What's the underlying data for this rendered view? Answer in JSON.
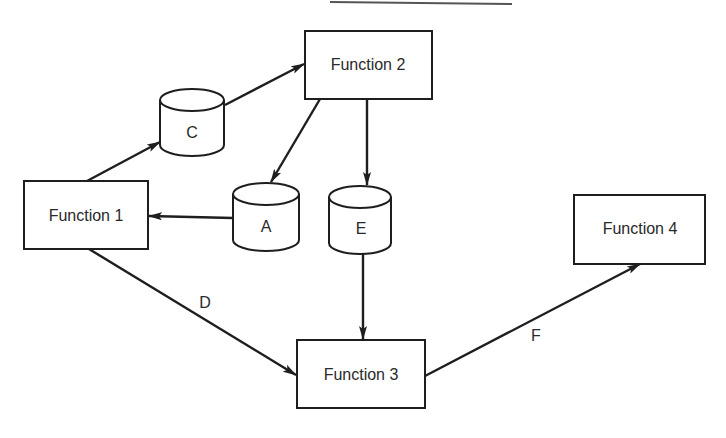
{
  "diagram": {
    "type": "data-flow",
    "processes": [
      {
        "id": "f1",
        "label": "Function 1",
        "x": 24,
        "y": 181,
        "w": 124,
        "h": 68
      },
      {
        "id": "f2",
        "label": "Function 2",
        "x": 305,
        "y": 31,
        "w": 127,
        "h": 68
      },
      {
        "id": "f3",
        "label": "Function 3",
        "x": 297,
        "y": 340,
        "w": 128,
        "h": 68
      },
      {
        "id": "f4",
        "label": "Function 4",
        "x": 574,
        "y": 195,
        "w": 131,
        "h": 69
      }
    ],
    "stores": [
      {
        "id": "c",
        "label": "C",
        "cx": 192,
        "top": 100,
        "bottom": 145,
        "rx": 32,
        "ry": 11
      },
      {
        "id": "a",
        "label": "A",
        "cx": 266,
        "top": 194,
        "bottom": 240,
        "rx": 33,
        "ry": 11
      },
      {
        "id": "e",
        "label": "E",
        "cx": 360,
        "top": 197,
        "bottom": 243,
        "rx": 31,
        "ry": 11
      }
    ],
    "flows": [
      {
        "from": "Function 1",
        "to": "C",
        "label": ""
      },
      {
        "from": "C",
        "to": "Function 2",
        "label": ""
      },
      {
        "from": "Function 2",
        "to": "A",
        "label": ""
      },
      {
        "from": "Function 2",
        "to": "E",
        "label": ""
      },
      {
        "from": "A",
        "to": "Function 1",
        "label": ""
      },
      {
        "from": "E",
        "to": "Function 3",
        "label": ""
      },
      {
        "from": "Function 1",
        "to": "Function 3",
        "label": "D"
      },
      {
        "from": "Function 3",
        "to": "Function 4",
        "label": "F"
      }
    ],
    "edge_labels": {
      "d": "D",
      "f": "F"
    }
  }
}
